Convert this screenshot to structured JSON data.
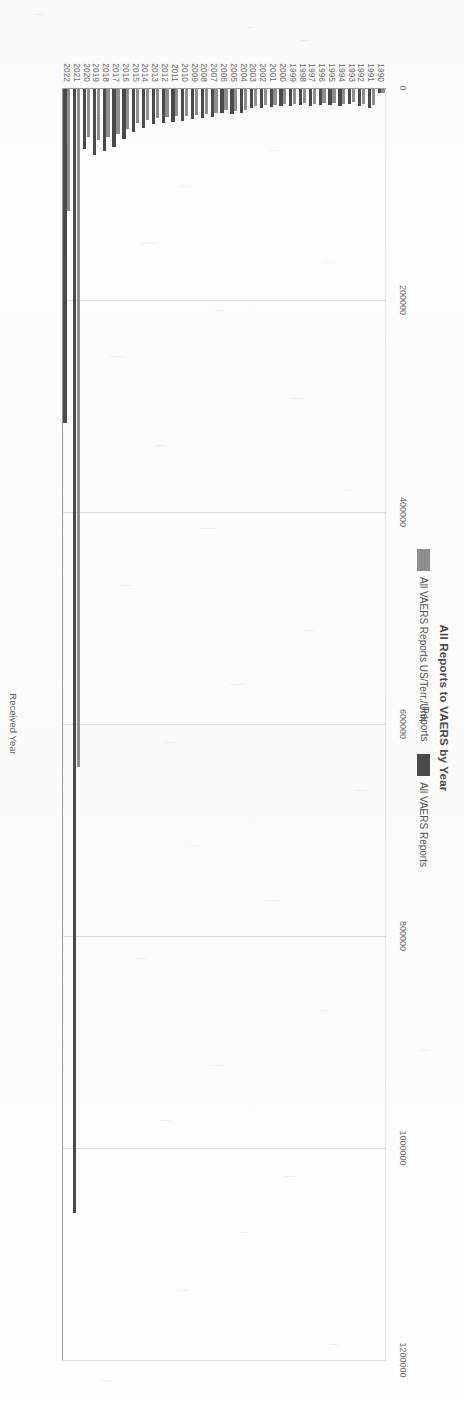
{
  "chart_data": {
    "type": "bar",
    "orientation": "horizontal-scan-rotated",
    "title": "All Reports to VAERS by Year",
    "xlabel": "Received Year",
    "ylabel": "Reports",
    "ylim": [
      0,
      1200000
    ],
    "ytick_labels": [
      "0",
      "200000",
      "400000",
      "600000",
      "800000",
      "1000000",
      "1200000"
    ],
    "ytick_values": [
      0,
      200000,
      400000,
      600000,
      800000,
      1000000,
      1200000
    ],
    "grid": true,
    "legend_position": "top-center",
    "categories": [
      "1990",
      "1991",
      "1992",
      "1993",
      "1994",
      "1995",
      "1996",
      "1997",
      "1998",
      "1999",
      "2000",
      "2001",
      "2002",
      "2003",
      "2004",
      "2005",
      "2006",
      "2007",
      "2008",
      "2009",
      "2010",
      "2011",
      "2012",
      "2013",
      "2014",
      "2015",
      "2016",
      "2017",
      "2018",
      "2019",
      "2020",
      "2021",
      "2022"
    ],
    "series": [
      {
        "name": "All VAERS Reports US/Terr./Unk.",
        "color": "#8e8e8e",
        "values": [
          3500,
          15500,
          13800,
          12600,
          13800,
          13200,
          13000,
          13800,
          13400,
          13900,
          14300,
          14800,
          15200,
          15900,
          19800,
          20500,
          19900,
          22800,
          23500,
          24200,
          25500,
          25800,
          26300,
          26900,
          29000,
          32500,
          37500,
          42500,
          45500,
          48500,
          45500,
          640000,
          115000
        ]
      },
      {
        "name": "All VAERS Reports",
        "color": "#4a4a4a",
        "values": [
          4000,
          17500,
          15600,
          14400,
          15800,
          15200,
          14800,
          15800,
          15200,
          15800,
          16500,
          17200,
          17600,
          18200,
          22500,
          23800,
          23000,
          26500,
          27500,
          28500,
          30500,
          31000,
          32000,
          33000,
          36500,
          41000,
          47500,
          54500,
          58500,
          62500,
          56500,
          1060000,
          315000
        ]
      }
    ]
  },
  "legend": {
    "items": [
      {
        "label": "All VAERS Reports US/Terr./Unk.",
        "color": "#8e8e8e"
      },
      {
        "label": "All VAERS Reports",
        "color": "#4a4a4a"
      }
    ]
  },
  "title": "All Reports to VAERS by Year",
  "axis": {
    "value_axis_title": "Reports",
    "category_axis_title": "Received Year"
  }
}
